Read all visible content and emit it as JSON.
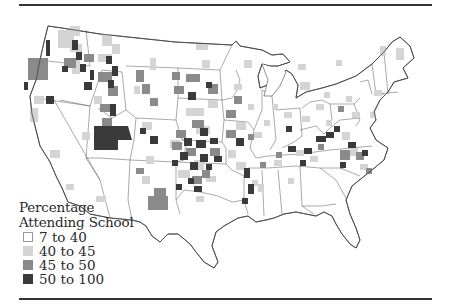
{
  "figure": {
    "type": "choropleth-map",
    "region": "Contiguous United States (county level)"
  },
  "legend": {
    "title_line1": "Percentage",
    "title_line2": "Attending School",
    "items": [
      {
        "label": "7 to 40",
        "color": "#ffffff"
      },
      {
        "label": "40 to 45",
        "color": "#d4d4d4"
      },
      {
        "label": "45 to 50",
        "color": "#8a8a8a"
      },
      {
        "label": "50 to 100",
        "color": "#3a3a3a"
      }
    ]
  },
  "colors": {
    "outline": "#444444",
    "rule": "#333333",
    "background": "#ffffff"
  }
}
